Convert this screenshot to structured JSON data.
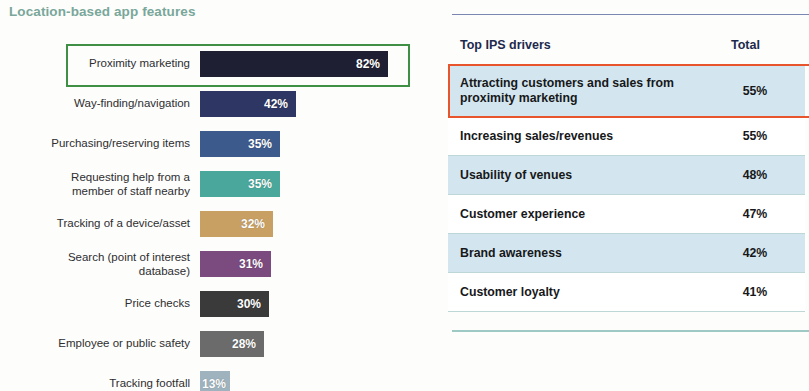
{
  "chart": {
    "title": "Location-based app features",
    "title_color": "#79a79a",
    "highlight_box_color": "#3f8f45"
  },
  "chart_data": {
    "type": "bar",
    "orientation": "horizontal",
    "title": "Location-based app features",
    "xlabel": "",
    "ylabel": "",
    "xlim": [
      0,
      100
    ],
    "grid": false,
    "legend": null,
    "categories": [
      "Proximity marketing",
      "Way-finding/navigation",
      "Purchasing/reserving items",
      "Requesting help from a\nmember of staff nearby",
      "Tracking of a device/asset",
      "Search (point of interest\ndatabase)",
      "Price checks",
      "Employee or public safety",
      "Tracking footfall"
    ],
    "values": [
      82,
      42,
      35,
      35,
      32,
      31,
      30,
      28,
      13
    ],
    "value_labels": [
      "82%",
      "42%",
      "35%",
      "35%",
      "32%",
      "31%",
      "30%",
      "28%",
      "13%"
    ],
    "bar_colors": [
      "#1f1f33",
      "#2e3663",
      "#3d5a8c",
      "#4aa79b",
      "#c9a063",
      "#7b4a7e",
      "#3a3a3a",
      "#6b6b6b",
      "#9fb3bf"
    ],
    "highlighted_category": "Proximity marketing"
  },
  "table": {
    "columns": [
      "Top IPS drivers",
      "Total"
    ],
    "highlight_box_color": "#e8542c",
    "rows": [
      {
        "driver": "Attracting customers and sales from\nproximity marketing",
        "total": "55%",
        "shaded": true,
        "highlighted": true
      },
      {
        "driver": "Increasing sales/revenues",
        "total": "55%",
        "shaded": false,
        "highlighted": false
      },
      {
        "driver": "Usability of venues",
        "total": "48%",
        "shaded": true,
        "highlighted": false
      },
      {
        "driver": "Customer experience",
        "total": "47%",
        "shaded": false,
        "highlighted": false
      },
      {
        "driver": "Brand awareness",
        "total": "42%",
        "shaded": true,
        "highlighted": false
      },
      {
        "driver": "Customer loyalty",
        "total": "41%",
        "shaded": false,
        "highlighted": false
      }
    ]
  }
}
